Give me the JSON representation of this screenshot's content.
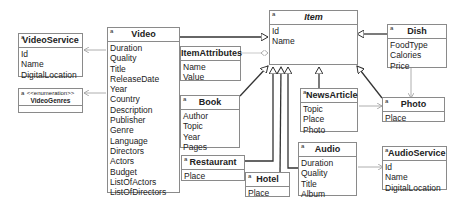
{
  "diagram": {
    "type": "uml-class-diagram",
    "classes": {
      "item": {
        "name": "Item",
        "abstract": true,
        "marker": "a",
        "attributes": [
          "Id",
          "Name"
        ]
      },
      "video_service": {
        "name": "VideoService",
        "marker": "a",
        "attributes": [
          "Id",
          "Name",
          "DigitalLocation"
        ]
      },
      "video_genres": {
        "name": "VideoGenres",
        "marker": "a",
        "stereotype": "<<enumeration>>",
        "attributes": []
      },
      "video": {
        "name": "Video",
        "marker": "a",
        "attributes": [
          "Duration",
          "Quality",
          "Title",
          "ReleaseDate",
          "Year",
          "Country",
          "Description",
          "Publisher",
          "Genre",
          "Language",
          "Directors",
          "Actors",
          "Budget",
          "ListOfActors",
          "ListOfDirectors"
        ]
      },
      "item_attributes": {
        "name": "ItemAttributes",
        "attributes": [
          "Name",
          "Value"
        ]
      },
      "book": {
        "name": "Book",
        "marker": "a",
        "attributes": [
          "Author",
          "Topic",
          "Year",
          "Pages"
        ]
      },
      "restaurant": {
        "name": "Restaurant",
        "marker": "a",
        "attributes": [
          "Place"
        ]
      },
      "hotel": {
        "name": "Hotel",
        "marker": "a",
        "attributes": [
          "Place"
        ]
      },
      "news_article": {
        "name": "NewsArticle",
        "marker": "a",
        "attributes": [
          "Topic",
          "Place",
          "Photo"
        ]
      },
      "audio": {
        "name": "Audio",
        "marker": "a",
        "attributes": [
          "Duration",
          "Quality",
          "Title",
          "Album"
        ]
      },
      "audio_service": {
        "name": "AudioService",
        "marker": "a",
        "attributes": [
          "Id",
          "Name",
          "DigitalLocation"
        ]
      },
      "dish": {
        "name": "Dish",
        "marker": "a",
        "attributes": [
          "FoodType",
          "Calories",
          "Price"
        ]
      },
      "photo": {
        "name": "Photo",
        "marker": "a",
        "attributes": [
          "Place"
        ]
      }
    },
    "relations": [
      {
        "from": "Video",
        "to": "Item",
        "type": "generalization"
      },
      {
        "from": "Book",
        "to": "Item",
        "type": "generalization"
      },
      {
        "from": "Restaurant",
        "to": "Item",
        "type": "generalization"
      },
      {
        "from": "Hotel",
        "to": "Item",
        "type": "generalization"
      },
      {
        "from": "Audio",
        "to": "Item",
        "type": "generalization"
      },
      {
        "from": "NewsArticle",
        "to": "Item",
        "type": "generalization"
      },
      {
        "from": "Photo",
        "to": "Item",
        "type": "generalization"
      },
      {
        "from": "Dish",
        "to": "Item",
        "type": "generalization"
      },
      {
        "from": "ItemAttributes",
        "to": "Item",
        "type": "aggregation"
      },
      {
        "from": "Video",
        "to": "VideoService",
        "type": "association"
      },
      {
        "from": "Video",
        "to": "VideoGenres",
        "type": "association"
      },
      {
        "from": "NewsArticle",
        "to": "Photo",
        "type": "association"
      },
      {
        "from": "Dish",
        "to": "Photo",
        "type": "association"
      },
      {
        "from": "Audio",
        "to": "AudioService",
        "type": "association"
      }
    ]
  }
}
